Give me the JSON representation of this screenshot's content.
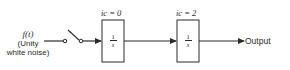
{
  "diagram": {
    "type": "block-diagram",
    "input": {
      "symbol": "f(t)",
      "description_line1": "(Unity",
      "description_line2": "white noise)"
    },
    "switch": {
      "state": "open"
    },
    "blocks": [
      {
        "id": "integrator-1",
        "transfer_num": "1",
        "transfer_den": "s",
        "initial_condition": "ic = 0"
      },
      {
        "id": "integrator-2",
        "transfer_num": "1",
        "transfer_den": "s",
        "initial_condition": "ic = 2"
      }
    ],
    "output": {
      "label": "Output"
    },
    "colors": {
      "line": "#2a2a2a",
      "background": "#ffffff"
    }
  }
}
